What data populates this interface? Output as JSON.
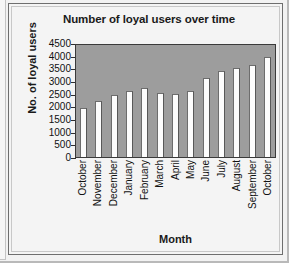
{
  "chart_data": {
    "type": "bar",
    "title": "Number of loyal users over time",
    "xlabel": "Month",
    "ylabel": "No. of loyal users",
    "categories": [
      "October",
      "November",
      "December",
      "January",
      "February",
      "March",
      "April",
      "May",
      "June",
      "July",
      "August",
      "September",
      "October"
    ],
    "values": [
      1950,
      2230,
      2450,
      2600,
      2730,
      2530,
      2500,
      2620,
      3110,
      3380,
      3530,
      3620,
      3950
    ],
    "yticks": [
      4500,
      4000,
      3500,
      3000,
      2500,
      2000,
      1500,
      1000,
      500,
      0
    ],
    "ylim": [
      0,
      4500
    ],
    "grid": false,
    "legend": "none",
    "series_name": "No. of loyal users",
    "plot_background_color": "#9d9d9d",
    "bar_fill_color": "#fdfdfd",
    "bar_edge_color": "#6d6d6d",
    "figure_background_color": "#f4f4f4",
    "text_color": "#111111"
  }
}
